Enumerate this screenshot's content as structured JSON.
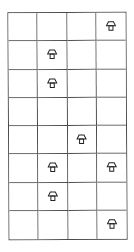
{
  "board": {
    "rows": 8,
    "cols": 4,
    "line_color": "#4a4a4a",
    "icon_color": "#222222",
    "icon": "mushroom-icon",
    "cells": [
      [
        false,
        false,
        false,
        true
      ],
      [
        false,
        true,
        false,
        false
      ],
      [
        false,
        true,
        false,
        false
      ],
      [
        false,
        false,
        false,
        false
      ],
      [
        false,
        false,
        true,
        false
      ],
      [
        false,
        true,
        false,
        true
      ],
      [
        false,
        true,
        false,
        false
      ],
      [
        false,
        false,
        false,
        true
      ]
    ]
  }
}
